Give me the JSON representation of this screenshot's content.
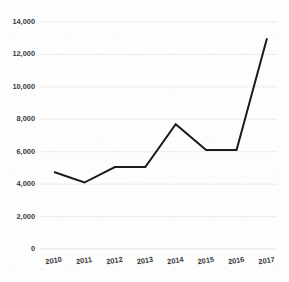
{
  "chart_data": {
    "type": "line",
    "title": "",
    "subtitle": "",
    "xlabel": "",
    "ylabel": "",
    "categories": [
      "2010",
      "2011",
      "2012",
      "2013",
      "2014",
      "2015",
      "2016",
      "2017"
    ],
    "values": [
      4750,
      4100,
      5050,
      5050,
      7700,
      6100,
      6100,
      13000
    ],
    "series": [
      {
        "name": "series-1",
        "values": [
          4750,
          4100,
          5050,
          5050,
          7700,
          6100,
          6100,
          13000
        ],
        "color": "#1b1b1b"
      }
    ],
    "ylim": [
      0,
      14000
    ],
    "yticks": [
      0,
      2000,
      4000,
      6000,
      8000,
      10000,
      12000,
      14000
    ],
    "ytick_labels": [
      "0",
      "2,000",
      "4,000",
      "6,000",
      "8,000",
      "10,000",
      "12,000",
      "14,000"
    ],
    "xtick_labels": [
      "2010",
      "2011",
      "2012",
      "2013",
      "2014",
      "2015",
      "2016",
      "2017"
    ],
    "grid": "horizontal",
    "legend": "none",
    "annotations": []
  },
  "style": {
    "line_color": "#1b1b1b",
    "grid_color": "#e9e9e9",
    "axis_color": "#e0e0e0",
    "label_color": "#3a3a3a",
    "background": "#fdfdfd"
  }
}
